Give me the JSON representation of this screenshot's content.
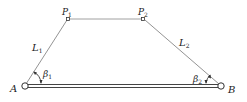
{
  "diagram": {
    "title": "",
    "type": "four-bar linkage",
    "nodes": [
      {
        "id": "A",
        "label": "A",
        "x": 25,
        "y": 86,
        "kind": "pivot"
      },
      {
        "id": "B",
        "label": "B",
        "x": 221,
        "y": 86,
        "kind": "pivot"
      },
      {
        "id": "P1",
        "label": "P",
        "sub": "1",
        "x": 68,
        "y": 19,
        "kind": "joint"
      },
      {
        "id": "P2",
        "label": "P",
        "sub": "2",
        "x": 143,
        "y": 19,
        "kind": "joint"
      }
    ],
    "links": [
      {
        "from": "A",
        "to": "P1",
        "label": "L",
        "sub": "1"
      },
      {
        "from": "P1",
        "to": "P2",
        "label": ""
      },
      {
        "from": "P2",
        "to": "B",
        "label": "L",
        "sub": "2"
      },
      {
        "from": "A",
        "to": "B",
        "label": "",
        "kind": "base-bar"
      }
    ],
    "angles": [
      {
        "at": "A",
        "label": "β",
        "sub": "1"
      },
      {
        "at": "B",
        "label": "β",
        "sub": "2"
      }
    ],
    "colors": {
      "line": "#555555",
      "text": "#222222",
      "background": "#ffffff"
    }
  }
}
